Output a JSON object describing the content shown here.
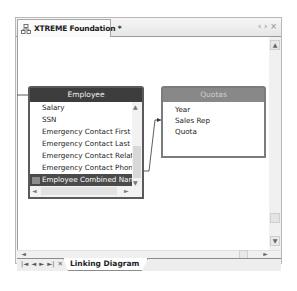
{
  "window": {
    "tab_title": "XTREME Foundation *",
    "tab_icon": "diagram-icon",
    "controls": [
      "‹",
      "›",
      "×"
    ]
  },
  "diagram": {
    "tables": [
      {
        "name": "Employee",
        "fields": [
          "Salary",
          "SSN",
          "Emergency Contact First Nam",
          "Emergency Contact Last Nam",
          "Emergency Contact Relations",
          "Emergency Contact Phone",
          "Employee Combined Name"
        ],
        "selected_field": "Employee Combined Name",
        "header_color": "#3d3d3d"
      },
      {
        "name": "Quotas",
        "fields": [
          "Year",
          "Sales Rep",
          "Quota"
        ],
        "header_color": "#888888"
      }
    ],
    "links": [
      {
        "from": "Employee.Employee Combined Name",
        "to": "Quotas.Sales Rep"
      }
    ]
  },
  "scrollbars": {
    "up": "▲",
    "down": "▼",
    "left": "◄",
    "right": "►"
  },
  "bottom_tabs": {
    "nav": [
      "|◄",
      "◄",
      "►",
      "►|",
      "✕"
    ],
    "sheets": [
      "Linking Diagram"
    ]
  }
}
